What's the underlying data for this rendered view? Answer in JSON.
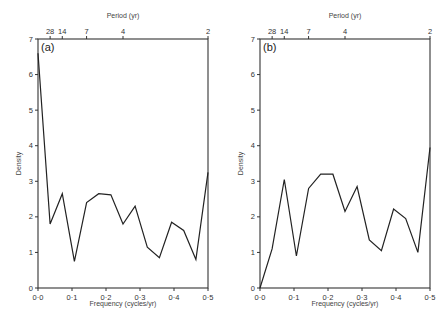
{
  "chart_data": [
    {
      "type": "line",
      "panel_label": "(a)",
      "title": "",
      "xlabel": "Frequency (cycles/yr)",
      "ylabel": "Density",
      "top_xlabel": "Period (yr)",
      "xlim": [
        0.0,
        0.5
      ],
      "ylim": [
        0,
        7
      ],
      "x_ticks": [
        "0·0",
        "0·1",
        "0·2",
        "0·3",
        "0·4",
        "0·5"
      ],
      "y_ticks": [
        "0",
        "1",
        "2",
        "3",
        "4",
        "5",
        "6",
        "7"
      ],
      "top_ticks": [
        {
          "label": "28",
          "freq": 0.0357
        },
        {
          "label": "14",
          "freq": 0.0714
        },
        {
          "label": "7",
          "freq": 0.1429
        },
        {
          "label": "4",
          "freq": 0.25
        },
        {
          "label": "2",
          "freq": 0.5
        }
      ],
      "grid": false,
      "x": [
        0.0,
        0.0357,
        0.0714,
        0.1071,
        0.1429,
        0.1786,
        0.2143,
        0.25,
        0.2857,
        0.3214,
        0.3571,
        0.3929,
        0.4286,
        0.4643,
        0.5
      ],
      "values": [
        6.6,
        1.8,
        2.65,
        0.75,
        2.4,
        2.65,
        2.62,
        1.8,
        2.3,
        1.15,
        0.85,
        1.85,
        1.62,
        0.8,
        3.25
      ]
    },
    {
      "type": "line",
      "panel_label": "(b)",
      "title": "",
      "xlabel": "Frequency (cycles/yr)",
      "ylabel": "Density",
      "top_xlabel": "Period (yr)",
      "xlim": [
        0.0,
        0.5
      ],
      "ylim": [
        0,
        7
      ],
      "x_ticks": [
        "0·0",
        "0·1",
        "0·2",
        "0·3",
        "0·4",
        "0·5"
      ],
      "y_ticks": [
        "0",
        "1",
        "2",
        "3",
        "4",
        "5",
        "6",
        "7"
      ],
      "top_ticks": [
        {
          "label": "28",
          "freq": 0.0357
        },
        {
          "label": "14",
          "freq": 0.0714
        },
        {
          "label": "7",
          "freq": 0.1429
        },
        {
          "label": "4",
          "freq": 0.25
        },
        {
          "label": "2",
          "freq": 0.5
        }
      ],
      "grid": false,
      "x": [
        0.0,
        0.0357,
        0.0714,
        0.1071,
        0.1429,
        0.1786,
        0.2143,
        0.25,
        0.2857,
        0.3214,
        0.3571,
        0.3929,
        0.4286,
        0.4643,
        0.5
      ],
      "values": [
        0.0,
        1.1,
        3.05,
        0.9,
        2.8,
        3.2,
        3.2,
        2.15,
        2.85,
        1.35,
        1.05,
        2.22,
        1.95,
        1.0,
        3.95
      ]
    }
  ]
}
